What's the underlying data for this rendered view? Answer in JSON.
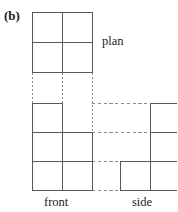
{
  "figure": {
    "part_label": "(b)",
    "type": "orthographic-projection-diagram",
    "labels": {
      "plan": "plan",
      "front": "front",
      "side": "side"
    },
    "colors": {
      "solid_line": "#595959",
      "projection_line": "#8c8c8c",
      "background": "#ffffff",
      "text": "#1a1a1a"
    },
    "geometry": {
      "cell": 30,
      "plan": {
        "x": 32,
        "y": 12,
        "cols": 2,
        "rows": 2,
        "filled_cells": [
          [
            0,
            0
          ],
          [
            1,
            0
          ],
          [
            0,
            1
          ],
          [
            1,
            1
          ]
        ]
      },
      "front": {
        "x": 32,
        "y": 103,
        "cols": 2,
        "rows": 3,
        "filled_cells": [
          [
            0,
            0
          ],
          [
            0,
            1
          ],
          [
            1,
            1
          ],
          [
            0,
            2
          ],
          [
            1,
            2
          ]
        ]
      },
      "side": {
        "x": 120,
        "y": 103,
        "cols": 2,
        "rows": 3,
        "filled_cells": [
          [
            1,
            0
          ],
          [
            1,
            1
          ],
          [
            0,
            2
          ],
          [
            1,
            2
          ]
        ]
      },
      "dotted_verticals_x": [
        32,
        62,
        92
      ],
      "dotted_vertical_span": [
        73,
        103
      ],
      "dashed_horizontals_y": [
        103,
        132,
        161,
        190
      ],
      "dashed_horizontal_span": [
        92,
        177
      ]
    }
  }
}
